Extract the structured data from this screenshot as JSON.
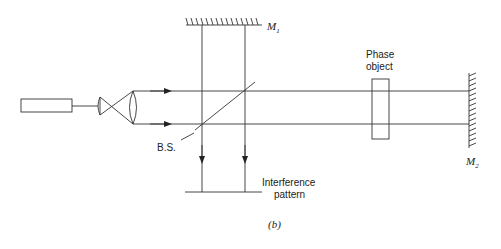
{
  "figure": {
    "caption": "(b)",
    "type": "Michelson-type interferometer with phase object",
    "components": {
      "laser": {
        "label": ""
      },
      "beam_expander": {
        "label": ""
      },
      "beam_splitter": {
        "label": "B.S."
      },
      "mirror_1": {
        "label": "M",
        "subscript": "1"
      },
      "mirror_2": {
        "label": "M",
        "subscript": "2"
      },
      "phase_object": {
        "label_line1": "Phase",
        "label_line2": "object"
      },
      "screen": {
        "label_line1": "Interference",
        "label_line2": "pattern"
      }
    },
    "colors": {
      "line": "#333333",
      "background": "#ffffff"
    }
  }
}
